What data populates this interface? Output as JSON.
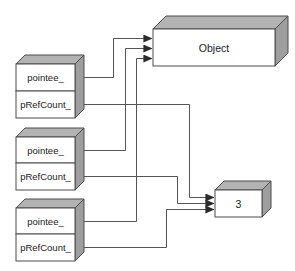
{
  "diagram": {
    "colors": {
      "face": "#ffffff",
      "top_face": "#b3b3b3",
      "side_face": "#9e9e9e",
      "stroke": "#4d4d4d",
      "line": "#555555",
      "text": "#1a1a1a",
      "background": "#ffffff"
    },
    "smart_pointers": [
      {
        "name": "smart-pointer-1",
        "fields": [
          {
            "name": "pointee-field",
            "label": "pointee_"
          },
          {
            "name": "prefcount-field",
            "label": "pRefCount_"
          }
        ]
      },
      {
        "name": "smart-pointer-2",
        "fields": [
          {
            "name": "pointee-field",
            "label": "pointee_"
          },
          {
            "name": "prefcount-field",
            "label": "pRefCount_"
          }
        ]
      },
      {
        "name": "smart-pointer-3",
        "fields": [
          {
            "name": "pointee-field",
            "label": "pointee_"
          },
          {
            "name": "prefcount-field",
            "label": "pRefCount_"
          }
        ]
      }
    ],
    "object_block": {
      "name": "object-block",
      "label": "Object"
    },
    "refcount_block": {
      "name": "refcount-block",
      "label": "3"
    },
    "connectors": {
      "pointee_arrow_count": 3,
      "prefcount_arrow_count": 3
    }
  }
}
